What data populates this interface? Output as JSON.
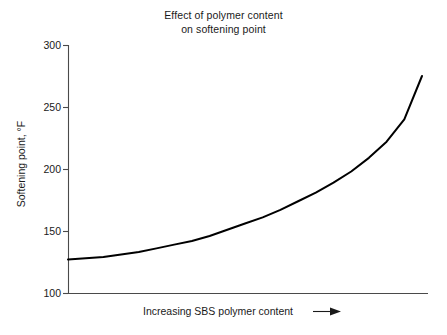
{
  "chart_data": {
    "type": "line",
    "title": "Effect of polymer content on softening point",
    "title_lines": [
      "Effect of polymer content",
      "on softening point"
    ],
    "xlabel": "Increasing SBS polymer content",
    "xlabel_arrow": "⟶",
    "ylabel": "Softening point, °F",
    "ylim": [
      100,
      300
    ],
    "yticks": [
      100,
      150,
      200,
      250,
      300
    ],
    "ytick_labels": [
      "100",
      "150",
      "200",
      "250",
      "300"
    ],
    "xticks": [],
    "xtick_labels": [],
    "grid": false,
    "legend": null,
    "axis_spines": [
      "left",
      "bottom"
    ],
    "xlim_relative": [
      0,
      100
    ],
    "series": [
      {
        "name": "Softening point",
        "color": "#000000",
        "line_width": 2,
        "x": [
          0,
          5,
          10,
          15,
          20,
          25,
          30,
          35,
          40,
          45,
          50,
          55,
          60,
          65,
          70,
          75,
          80,
          85,
          90,
          95,
          100
        ],
        "values": [
          127,
          128,
          129,
          131,
          133,
          136,
          139,
          142,
          146,
          151,
          156,
          161,
          167,
          174,
          181,
          189,
          198,
          209,
          222,
          240,
          275
        ]
      }
    ]
  },
  "axes": {
    "plot_left_px": 68,
    "plot_right_px": 428,
    "plot_top_px": 45,
    "plot_bottom_px": 293
  }
}
